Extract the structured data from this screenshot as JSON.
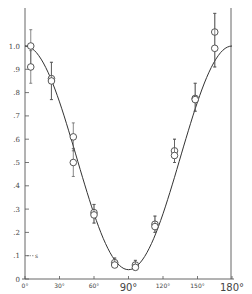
{
  "chart_data": {
    "type": "scatter",
    "title": "",
    "xlabel": "",
    "ylabel": "",
    "xlim": [
      0,
      180
    ],
    "ylim": [
      0,
      1.1
    ],
    "grid": false,
    "legend": null,
    "x_ticks": [
      {
        "value": 0,
        "label": "0°",
        "big": false
      },
      {
        "value": 30,
        "label": "30°",
        "big": false
      },
      {
        "value": 60,
        "label": "60°",
        "big": false
      },
      {
        "value": 90,
        "label": "90°",
        "big": true
      },
      {
        "value": 120,
        "label": "120°",
        "big": false
      },
      {
        "value": 150,
        "label": "150°",
        "big": false
      },
      {
        "value": 180,
        "label": "180°",
        "big": true
      }
    ],
    "y_ticks": [
      {
        "value": 0,
        "label": "0"
      },
      {
        "value": 0.1,
        "label": ".1"
      },
      {
        "value": 0.2,
        "label": ".2"
      },
      {
        "value": 0.3,
        "label": ".3"
      },
      {
        "value": 0.4,
        "label": ".4"
      },
      {
        "value": 0.5,
        "label": ".5"
      },
      {
        "value": 0.6,
        "label": ".6"
      },
      {
        "value": 0.7,
        "label": ".7"
      },
      {
        "value": 0.8,
        "label": ".8"
      },
      {
        "value": 0.9,
        "label": ".9"
      },
      {
        "value": 1.0,
        "label": "1.0"
      }
    ],
    "annotations": [
      {
        "text": "s",
        "x": 0,
        "y": 0.1,
        "note": "dashed marker at y=0.1 labeled s"
      }
    ],
    "series": [
      {
        "name": "measured",
        "marker": "open-circle",
        "points": [
          {
            "x": 5,
            "y": 1.0,
            "err_low": 0.92,
            "err_high": 1.07
          },
          {
            "x": 5,
            "y": 0.91,
            "err_low": 0.84,
            "err_high": 0.98
          },
          {
            "x": 23,
            "y": 0.86,
            "err_low": 0.77,
            "err_high": 0.93
          },
          {
            "x": 23,
            "y": 0.85,
            "err_low": 0.77,
            "err_high": 0.93
          },
          {
            "x": 42,
            "y": 0.61,
            "err_low": 0.55,
            "err_high": 0.67
          },
          {
            "x": 42,
            "y": 0.5,
            "err_low": 0.44,
            "err_high": 0.56
          },
          {
            "x": 60,
            "y": 0.285,
            "err_low": 0.24,
            "err_high": 0.32
          },
          {
            "x": 60,
            "y": 0.275,
            "err_low": 0.24,
            "err_high": 0.32
          },
          {
            "x": 78,
            "y": 0.07,
            "err_low": 0.05,
            "err_high": 0.09
          },
          {
            "x": 78,
            "y": 0.06,
            "err_low": 0.05,
            "err_high": 0.09
          },
          {
            "x": 96,
            "y": 0.06,
            "err_low": 0.04,
            "err_high": 0.08
          },
          {
            "x": 96,
            "y": 0.05,
            "err_low": 0.04,
            "err_high": 0.08
          },
          {
            "x": 113,
            "y": 0.235,
            "err_low": 0.2,
            "err_high": 0.27
          },
          {
            "x": 113,
            "y": 0.225,
            "err_low": 0.2,
            "err_high": 0.27
          },
          {
            "x": 130,
            "y": 0.55,
            "err_low": 0.5,
            "err_high": 0.6
          },
          {
            "x": 130,
            "y": 0.53,
            "err_low": 0.5,
            "err_high": 0.6
          },
          {
            "x": 148,
            "y": 0.775,
            "err_low": 0.72,
            "err_high": 0.84
          },
          {
            "x": 148,
            "y": 0.77,
            "err_low": 0.72,
            "err_high": 0.84
          },
          {
            "x": 165,
            "y": 1.06,
            "err_low": 0.91,
            "err_high": 1.14
          },
          {
            "x": 165,
            "y": 0.99,
            "err_low": 0.91,
            "err_high": 1.14
          }
        ]
      },
      {
        "name": "theory",
        "type": "line",
        "function": "approx cos^2(theta) with minimum ~0.04 near 90°",
        "x": [
          0,
          15,
          30,
          45,
          60,
          75,
          90,
          105,
          120,
          135,
          150,
          165,
          180
        ],
        "y": [
          1.0,
          0.93,
          0.76,
          0.53,
          0.29,
          0.1,
          0.04,
          0.11,
          0.3,
          0.53,
          0.76,
          0.94,
          1.0
        ]
      }
    ]
  }
}
